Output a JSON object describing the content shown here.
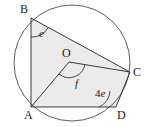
{
  "figure": {
    "type": "circle-geometry-diagram",
    "colors": {
      "stroke": "#3a3a3a",
      "circle_stroke": "#4a4a4a",
      "fill": "#ebebeb",
      "text": "#1a1a1a",
      "background": "#ffffff"
    },
    "circle": {
      "centre_label": "O",
      "cx": 72,
      "cy": 63,
      "r": 58
    },
    "points": [
      {
        "id": "A",
        "label": "A",
        "x": 31,
        "y": 107,
        "label_x": 24,
        "label_y": 109
      },
      {
        "id": "B",
        "label": "B",
        "x": 31,
        "y": 18,
        "label_x": 20,
        "label_y": 3
      },
      {
        "id": "C",
        "label": "C",
        "x": 130,
        "y": 72,
        "label_x": 133,
        "label_y": 66
      },
      {
        "id": "D",
        "label": "D",
        "x": 116,
        "y": 107,
        "label_x": 117,
        "label_y": 109
      },
      {
        "id": "O",
        "label": "O",
        "x": 69,
        "y": 62,
        "label_x": 62,
        "label_y": 47
      }
    ],
    "segments": [
      {
        "name": "AB",
        "from": "A",
        "to": "B"
      },
      {
        "name": "BC",
        "from": "B",
        "to": "C"
      },
      {
        "name": "AO",
        "from": "A",
        "to": "O"
      },
      {
        "name": "OC",
        "from": "O",
        "to": "C"
      },
      {
        "name": "AD",
        "from": "A",
        "to": "D"
      },
      {
        "name": "DC",
        "from": "D",
        "to": "C"
      }
    ],
    "angles": [
      {
        "id": "e",
        "label": "e",
        "at": "B",
        "label_x": 39,
        "label_y": 28,
        "compound": false
      },
      {
        "id": "f",
        "label": "f",
        "at": "O",
        "label_x": 75,
        "label_y": 78,
        "compound": false
      },
      {
        "id": "4e",
        "label": "4e",
        "prefix": "4",
        "variable": "e",
        "at": "D",
        "label_x": 95,
        "label_y": 88,
        "compound": true
      }
    ]
  }
}
